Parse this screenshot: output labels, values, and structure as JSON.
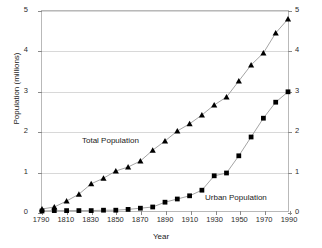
{
  "chart_data": {
    "type": "line",
    "title": "",
    "xlabel": "Year",
    "ylabel": "Population (millions)",
    "xlim": [
      1790,
      1990
    ],
    "ylim": [
      0,
      5
    ],
    "grid": "horizontal",
    "legend_position": "inline-annotations",
    "x": [
      1790,
      1800,
      1810,
      1820,
      1830,
      1840,
      1850,
      1860,
      1870,
      1880,
      1890,
      1900,
      1910,
      1920,
      1930,
      1940,
      1950,
      1960,
      1970,
      1980,
      1990
    ],
    "x_ticks": [
      "1790",
      "1810",
      "1830",
      "1850",
      "1870",
      "1890",
      "1910",
      "1930",
      "1950",
      "1970",
      "1990"
    ],
    "y_ticks_left": [
      "0",
      "1",
      "2",
      "3",
      "4",
      "5"
    ],
    "y_ticks_right": [
      "0",
      "1",
      "2",
      "3",
      "4",
      "5"
    ],
    "series": [
      {
        "name": "Total Population",
        "marker": "triangle",
        "values": [
          0.05,
          0.1,
          0.25,
          0.42,
          0.68,
          0.82,
          1.0,
          1.1,
          1.25,
          1.52,
          1.75,
          2.0,
          2.18,
          2.4,
          2.65,
          2.85,
          3.25,
          3.65,
          3.95,
          4.45,
          4.8
        ]
      },
      {
        "name": "Urban Population",
        "marker": "square",
        "values": [
          0.0,
          0.01,
          0.01,
          0.01,
          0.01,
          0.02,
          0.02,
          0.04,
          0.07,
          0.1,
          0.22,
          0.3,
          0.38,
          0.52,
          0.88,
          0.95,
          1.38,
          1.85,
          2.32,
          2.72,
          2.98
        ]
      }
    ],
    "annotations": [
      {
        "text": "Total Population",
        "x": 1840,
        "y": 2.05
      },
      {
        "text": "Urban Population",
        "x": 1945,
        "y": 0.62
      }
    ],
    "colors": {
      "marker": "#000000",
      "line": "#999999",
      "gridline": "#d8d8d8",
      "axis": "#b9b9b9",
      "text": "#1a1a1a"
    }
  }
}
